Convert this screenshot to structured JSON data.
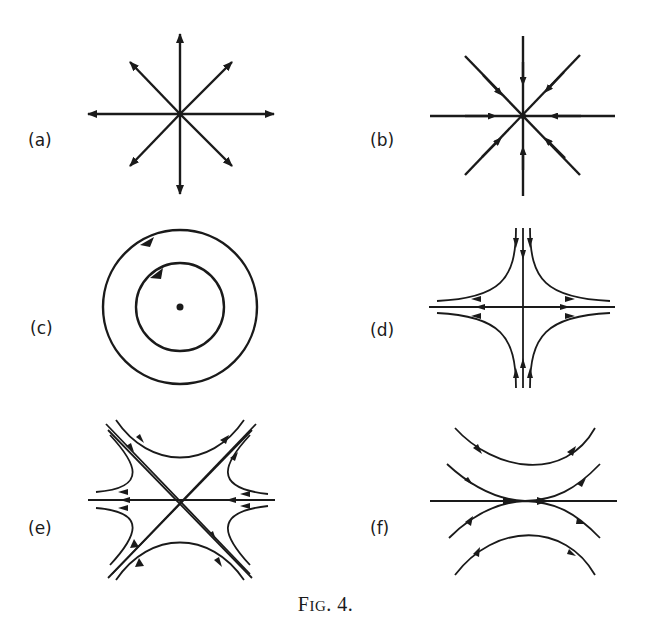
{
  "figure": {
    "caption_first": "F",
    "caption_smallcaps": "IG",
    "caption_rest": ". 4.",
    "stroke_color": "#1a1a1a",
    "background": "#ffffff"
  },
  "panels": [
    {
      "id": "a",
      "label": "(a)",
      "type": "unstable node (source)",
      "description": "eight radial rays with arrowheads pointing outward from center"
    },
    {
      "id": "b",
      "label": "(b)",
      "type": "stable node (sink)",
      "description": "eight radial rays with arrowheads pointing inward toward center"
    },
    {
      "id": "c",
      "label": "(c)",
      "type": "center",
      "description": "two concentric closed orbits with clockwise arrows around a central point"
    },
    {
      "id": "d",
      "label": "(d)",
      "type": "saddle point",
      "description": "inflow along vertical axis, outflow along horizontal axis, hyperbolic trajectories in four quadrants"
    },
    {
      "id": "e",
      "label": "(e)",
      "type": "saddle point (diagonal)",
      "description": "diagonal separatrices crossing with hyperbolic trajectories, inflow from NW/SE and right, outflow to NE/left"
    },
    {
      "id": "f",
      "label": "(f)",
      "type": "degenerate / tangent point",
      "description": "horizontal line with parabolic trajectories tangent at center, flow left to right"
    }
  ]
}
